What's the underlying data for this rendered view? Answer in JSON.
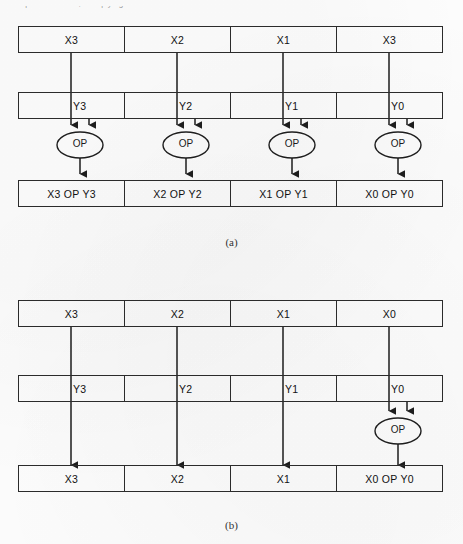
{
  "page": {
    "cut_text_top": "ments per instruction, multiplying a time",
    "line_color": "#2b2b2b",
    "text_color": "#111111"
  },
  "figure_a": {
    "caption": "(a)",
    "operand_x_row": {
      "name": "x-register",
      "cells": [
        "X3",
        "X2",
        "X1",
        "X3"
      ]
    },
    "operand_y_row": {
      "name": "y-register",
      "cells": [
        "Y3",
        "Y2",
        "Y1",
        "Y0"
      ]
    },
    "operators": [
      "OP",
      "OP",
      "OP",
      "OP"
    ],
    "result_row": {
      "name": "result-register",
      "cells": [
        "X3 OP Y3",
        "X2 OP Y2",
        "X1 OP Y1",
        "X0 OP Y0"
      ]
    }
  },
  "figure_b": {
    "caption": "(b)",
    "operand_x_row": {
      "name": "x-register",
      "cells": [
        "X3",
        "X2",
        "X1",
        "X0"
      ]
    },
    "operand_y_row": {
      "name": "y-register",
      "cells": [
        "Y3",
        "Y2",
        "Y1",
        "Y0"
      ]
    },
    "operators": [
      "OP"
    ],
    "result_row": {
      "name": "result-register",
      "cells": [
        "X3",
        "X2",
        "X1",
        "X0 OP Y0"
      ]
    }
  }
}
